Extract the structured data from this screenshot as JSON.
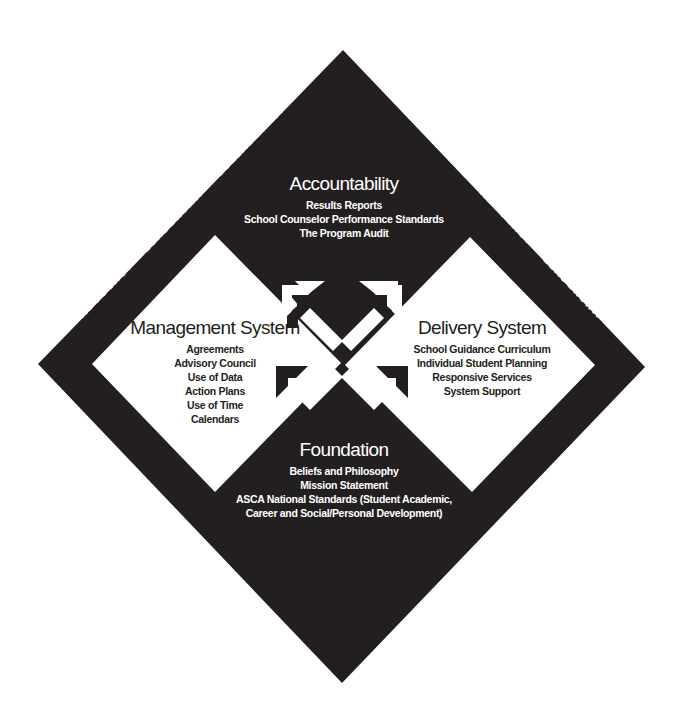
{
  "colors": {
    "background": "#ffffff",
    "diamond": "#231f20",
    "inner_panel": "#ffffff",
    "text_on_dark": "#ffffff",
    "text_on_light": "#231f20"
  },
  "quadrants": {
    "top": {
      "title": "Accountability",
      "items": [
        "Results Reports",
        "School Counselor Performance Standards",
        "The Program Audit"
      ]
    },
    "left": {
      "title": "Management System",
      "items": [
        "Agreements",
        "Advisory Council",
        "Use of Data",
        "Action Plans",
        "Use of Time",
        "Calendars"
      ]
    },
    "right": {
      "title": "Delivery System",
      "items": [
        "School Guidance Curriculum",
        "Individual Student Planning",
        "Responsive Services",
        "System Support"
      ]
    },
    "bottom": {
      "title": "Foundation",
      "items": [
        "Beliefs and Philosophy",
        "Mission Statement",
        "ASCA National Standards (Student Academic,",
        "Career and Social/Personal Development)"
      ]
    }
  },
  "border_text": {
    "top_left": "• ADVOCACY • LEADERSHIP • COLLABORATION •",
    "top_right": "SYSTEMIC CHANGE • ADVOCACY • LEADERSHIP •",
    "bottom_right": "• COLLABORATION • SYSTEMIC CHANGE • ADVOCACY •",
    "bottom_left": "• SYSTEMIC CHANGE • COLLABORATION • LEADERSHIP •"
  },
  "center_icon": "four-way-arrows-icon"
}
